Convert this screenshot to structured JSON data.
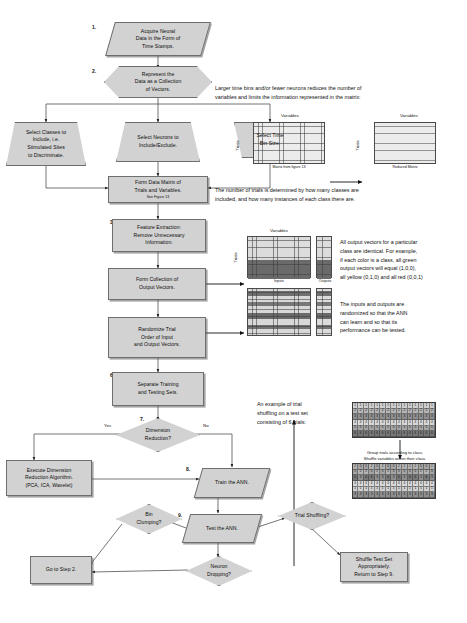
{
  "flowchart": {
    "steps": [
      {
        "num": "1.",
        "name": "acquire-neural-data",
        "shape": "parallelogram",
        "lines": [
          "Acquire Neural",
          "Data in the Form of",
          "Time Stamps."
        ]
      },
      {
        "num": "2.",
        "name": "represent-data-as-vectors",
        "shape": "hexagon",
        "lines": [
          "Represent the",
          "Data as a Collection",
          "of Vectors."
        ]
      },
      {
        "num": "",
        "name": "select-classes",
        "shape": "trapezoid",
        "lines": [
          "Select Classes to",
          "Include, i.e.",
          "Stimulated Sites",
          "to Discriminate."
        ]
      },
      {
        "num": "",
        "name": "select-neurons",
        "shape": "trapezoid",
        "lines": [
          "Select Neurons to",
          "Include/Exclude."
        ]
      },
      {
        "num": "",
        "name": "select-time-bin-size",
        "shape": "trapezoid",
        "lines": [
          "Select Time",
          "Bin Size."
        ]
      },
      {
        "num": "",
        "name": "form-data-matrix",
        "shape": "process",
        "lines": [
          "Form Data Matrix of",
          "Trials and Variables."
        ],
        "sub": "See Figure 13"
      },
      {
        "num": "3.",
        "name": "feature-extraction",
        "shape": "process",
        "lines": [
          "Feature Extraction:",
          "Remove Unnecessary",
          "Information."
        ]
      },
      {
        "num": "4.",
        "name": "form-output-vectors",
        "shape": "process",
        "lines": [
          "Form Collection of",
          "Output Vectors."
        ]
      },
      {
        "num": "5.",
        "name": "randomize-trial-order",
        "shape": "process",
        "lines": [
          "Randomize Trial",
          "Order of Input",
          "and Output Vectors."
        ]
      },
      {
        "num": "6.",
        "name": "separate-training-testing",
        "shape": "process",
        "lines": [
          "Separate Training",
          "and Testing Sets."
        ]
      },
      {
        "num": "7.",
        "name": "dimension-reduction-decision",
        "shape": "diamond",
        "lines": [
          "Dimension",
          "Reduction?"
        ]
      },
      {
        "num": "",
        "name": "execute-dimension-reduction",
        "shape": "process",
        "lines": [
          "Execute Dimension",
          "Reduction Algorithm.",
          "(PCA, ICA, Wavelet)"
        ]
      },
      {
        "num": "8.",
        "name": "train-the-ann",
        "shape": "parallelogram",
        "lines": [
          "Train the ANN."
        ]
      },
      {
        "num": "9.",
        "name": "test-the-ann",
        "shape": "parallelogram",
        "lines": [
          "Test the ANN."
        ]
      },
      {
        "num": "",
        "name": "bin-clumping-decision",
        "shape": "diamond",
        "lines": [
          "Bin",
          "Clumping?"
        ]
      },
      {
        "num": "",
        "name": "neuron-dropping-decision",
        "shape": "diamond",
        "lines": [
          "Neuron",
          "Dropping?"
        ]
      },
      {
        "num": "",
        "name": "trial-shuffling-decision",
        "shape": "diamond",
        "lines": [
          "Trial Shuffling?"
        ]
      },
      {
        "num": "",
        "name": "go-to-step-2",
        "shape": "process",
        "lines": [
          "Go to Step 2."
        ]
      },
      {
        "num": "",
        "name": "shuffle-test-set",
        "shape": "process",
        "lines": [
          "Shuffle Test Set",
          "Appropriately.",
          "Return to Step 9."
        ]
      }
    ],
    "edge_labels": {
      "yes": "Yes",
      "no": "No"
    }
  },
  "annotations": {
    "matrix_reduction": {
      "text": [
        "Larger time bins and/or fewer neurons reduces the number of",
        "variables and limits the information represented in the matrix:"
      ],
      "left_matrix_caption": "Matrix from figure 13",
      "right_matrix_caption": "Reduced Matrix",
      "axis_x": "Variables",
      "axis_y": "Trials",
      "footer": [
        "The number of trials is determined by how many classes are",
        "included, and how many instances of each class there are."
      ]
    },
    "output_vectors": {
      "text": [
        "All output vectors for a particular",
        "class are identical.  For example,",
        "if each color is a class, all green",
        "output vectors will equal (1,0,0),",
        "all yellow (0,1,0) and all red (0,0,1)"
      ],
      "axis_x": "Variables",
      "axis_y": "Trials",
      "inputs_caption": "Inputs",
      "outputs_caption": "Outputs"
    },
    "randomization": {
      "text": [
        "The inputs and outputs are",
        "randomized so that the ANN",
        "can learn and so that its",
        "performance can be tested."
      ]
    },
    "trial_shuffling": {
      "text": [
        "An example of trial",
        "shuffling on a test set",
        "consisting of 6 trials:"
      ],
      "middle_text": [
        "Group trials according to class.",
        "Shuffle variables within their class."
      ]
    }
  },
  "shuffle_grids": {
    "before": [
      [
        1,
        1,
        1,
        1,
        1,
        1,
        1,
        1,
        1,
        1,
        1,
        1,
        1,
        1,
        1
      ],
      [
        2,
        2,
        2,
        2,
        2,
        2,
        2,
        2,
        2,
        2,
        2,
        2,
        2,
        2,
        2
      ],
      [
        3,
        3,
        3,
        3,
        3,
        3,
        3,
        3,
        3,
        3,
        3,
        3,
        3,
        3,
        3
      ],
      [
        4,
        4,
        4,
        4,
        4,
        4,
        4,
        4,
        4,
        4,
        4,
        4,
        4,
        4,
        4
      ],
      [
        5,
        5,
        5,
        5,
        5,
        5,
        5,
        5,
        5,
        5,
        5,
        5,
        5,
        5,
        5
      ],
      [
        6,
        6,
        6,
        6,
        6,
        6,
        6,
        6,
        6,
        6,
        6,
        6,
        6,
        6,
        6
      ]
    ],
    "after": [
      [
        2,
        5,
        5,
        2,
        5,
        2,
        5,
        5,
        2,
        2,
        2,
        2,
        5,
        5,
        2
      ],
      [
        5,
        2,
        2,
        5,
        2,
        5,
        2,
        5,
        5,
        5,
        5,
        5,
        2,
        2,
        5
      ],
      [
        6,
        3,
        6,
        6,
        3,
        3,
        6,
        3,
        6,
        3,
        6,
        6,
        3,
        6,
        3
      ],
      [
        4,
        4,
        4,
        4,
        4,
        4,
        4,
        4,
        4,
        4,
        4,
        4,
        4,
        4,
        4
      ],
      [
        1,
        1,
        1,
        1,
        1,
        1,
        1,
        1,
        1,
        1,
        1,
        1,
        1,
        1,
        1
      ],
      [
        3,
        3,
        3,
        3,
        3,
        3,
        3,
        3,
        3,
        3,
        3,
        3,
        3,
        3,
        3
      ]
    ]
  },
  "colors": {
    "node_fill": "#d2d2d2",
    "node_stroke": "#6e6e6e",
    "shadow": "#8a8a8a",
    "text": "#111111",
    "matrix_stroke": "#4a4a4a"
  }
}
